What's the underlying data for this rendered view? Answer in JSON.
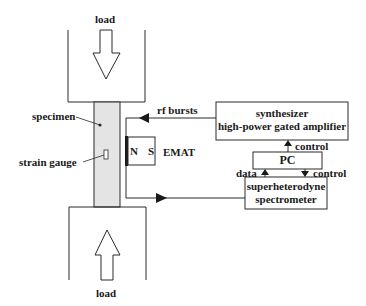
{
  "diagram": {
    "labels": {
      "load_top": "load",
      "load_bottom": "load",
      "specimen": "specimen",
      "strain_gauge": "strain gauge",
      "rf_bursts": "rf bursts",
      "emat": "EMAT",
      "magnet_n": "N",
      "magnet_s": "S",
      "control_upper": "control",
      "control_lower": "control",
      "data": "data"
    },
    "boxes": {
      "synthesizer_line1": "synthesizer",
      "synthesizer_line2": "high-power gated amplifier",
      "pc": "PC",
      "spectrometer_line1": "superheterodyne",
      "spectrometer_line2": "spectrometer"
    },
    "colors": {
      "line": "#2a2a2a",
      "specimen_fill": "#e4e4e4",
      "background": "#ffffff"
    }
  }
}
